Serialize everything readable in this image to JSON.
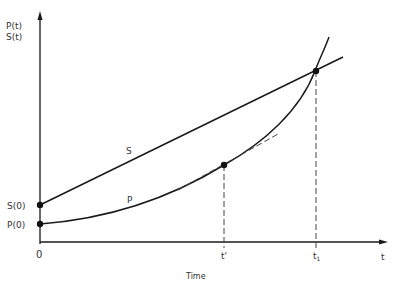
{
  "diagram": {
    "y_axis_label_line1": "P(t)",
    "y_axis_label_line2": "S(t)",
    "x_axis_label": "t",
    "x_axis_title": "Time",
    "origin_label": "0",
    "s0_label": "S(0)",
    "p0_label": "P(0)",
    "curve_s_label": "S",
    "curve_p_label": "P",
    "tick_tprime": "t'",
    "tick_t1_base": "t",
    "tick_t1_sub": "1",
    "colors": {
      "line": "#1a1a1a",
      "dashed": "#444444",
      "text": "#333333"
    }
  }
}
